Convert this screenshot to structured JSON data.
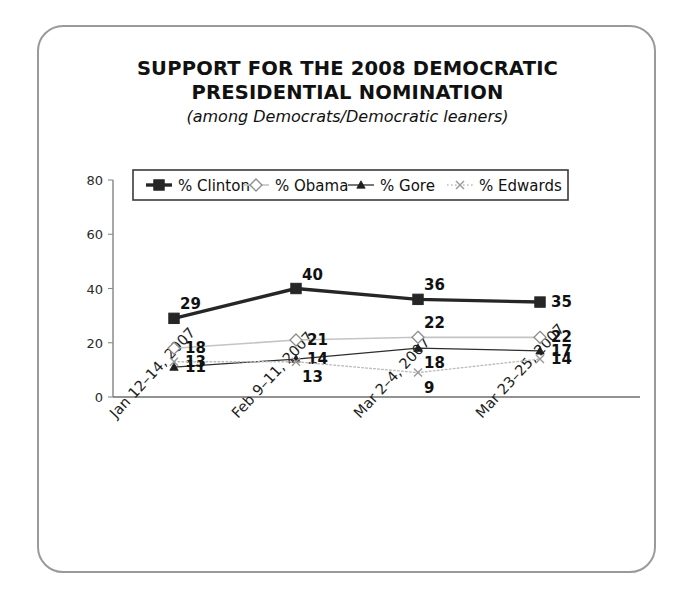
{
  "card": {
    "title_line_1": "SUPPORT FOR THE 2008 DEMOCRATIC",
    "title_line_2": "PRESIDENTIAL NOMINATION",
    "subtitle": "(among Democrats/Democratic leaners)"
  },
  "chart_data": {
    "type": "line",
    "title": "SUPPORT FOR THE 2008 DEMOCRATIC PRESIDENTIAL NOMINATION",
    "subtitle": "(among Democrats/Democratic leaners)",
    "xlabel": "",
    "ylabel": "",
    "ylim": [
      0,
      80
    ],
    "yticks": [
      0,
      20,
      40,
      60,
      80
    ],
    "grid": false,
    "legend_position": "top-inside",
    "categories": [
      "Jan 12–14, 2007",
      "Feb 9–11, 2007",
      "Mar 2–4, 2007",
      "Mar 23–25, 2007"
    ],
    "series": [
      {
        "name": "% Clinton",
        "color": "#262626",
        "marker": "square",
        "line": "solid",
        "width": 3.4,
        "values": [
          29,
          40,
          36,
          35
        ],
        "label_pos": [
          "above",
          "above",
          "above",
          "right"
        ]
      },
      {
        "name": "% Obama",
        "color": "#c4c4c4",
        "marker": "diamond",
        "line": "solid",
        "width": 1.6,
        "values": [
          18,
          21,
          22,
          22
        ],
        "label_pos": [
          "right",
          "right",
          "above",
          "right"
        ]
      },
      {
        "name": "% Gore",
        "color": "#2e2e2e",
        "marker": "triangle",
        "line": "solid",
        "width": 1.3,
        "values": [
          11,
          14,
          18,
          17
        ],
        "label_pos": [
          "right",
          "right",
          "below",
          "right"
        ]
      },
      {
        "name": "% Edwards",
        "color": "#bdbdbd",
        "marker": "x",
        "line": "dotted",
        "width": 1.4,
        "values": [
          13,
          13,
          9,
          14
        ],
        "label_pos": [
          "right",
          "below",
          "below",
          "right"
        ]
      }
    ]
  }
}
